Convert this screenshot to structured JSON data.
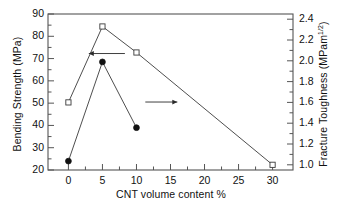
{
  "chart_data": {
    "type": "line",
    "title": "",
    "xlabel": "CNT volume content  %",
    "ylabel": "Bending Strength (MPa)",
    "ylabel_right_main": "Fracture Toughness (MPam",
    "ylabel_right_sup": "1/2",
    "ylabel_right_tail": ")",
    "xlim": [
      -3,
      33
    ],
    "ylim": [
      20,
      90
    ],
    "ylim_right": [
      0.95,
      2.45
    ],
    "xticks": [
      0,
      5,
      10,
      15,
      20,
      25,
      30
    ],
    "xticklabels": [
      "0",
      "5",
      "10",
      "15",
      "20",
      "25",
      "30"
    ],
    "yticks": [
      20,
      30,
      40,
      50,
      60,
      70,
      80,
      90
    ],
    "yticklabels": [
      "20",
      "30",
      "40",
      "50",
      "60",
      "70",
      "80",
      "90"
    ],
    "yticks_right": [
      1.0,
      1.2,
      1.4,
      1.6,
      1.8,
      2.0,
      2.2,
      2.4
    ],
    "yticklabels_right": [
      "1.0",
      "1.2",
      "1.4",
      "1.6",
      "1.8",
      "2.0",
      "2.2",
      "2.4"
    ],
    "grid": false,
    "legend": "none",
    "minor_ticks": true,
    "series": [
      {
        "name": "Fracture Toughness",
        "axis": "right",
        "marker": "open-square",
        "x": [
          0,
          5,
          10,
          30
        ],
        "values": [
          1.6,
          2.33,
          2.08,
          1.0
        ]
      },
      {
        "name": "Bending Strength",
        "axis": "left",
        "marker": "filled-circle",
        "x": [
          0,
          5,
          10
        ],
        "values": [
          24,
          68.5,
          39
        ]
      }
    ],
    "annotations": [
      {
        "name": "arrow-to-left-axis",
        "direction": "left",
        "x_from": 8.3,
        "x_to": 3.0,
        "y_right": 2.07
      },
      {
        "name": "arrow-to-right-axis",
        "direction": "right",
        "x_from": 11.3,
        "x_to": 16.0,
        "y_left": 50.5
      }
    ]
  }
}
